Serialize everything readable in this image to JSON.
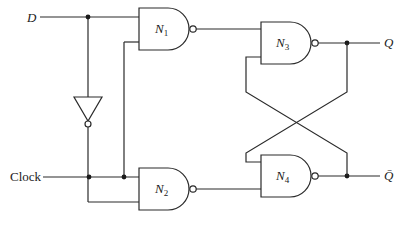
{
  "diagram": {
    "inputs": {
      "d": {
        "label": "D"
      },
      "clock": {
        "label": "Clock"
      }
    },
    "outputs": {
      "q": {
        "label": "Q"
      },
      "q_bar": {
        "label": "Q̄"
      }
    },
    "gates": [
      {
        "id": "N1",
        "type": "NAND",
        "name": "N",
        "subscript": "1"
      },
      {
        "id": "N2",
        "type": "NAND",
        "name": "N",
        "subscript": "2"
      },
      {
        "id": "N3",
        "type": "NAND",
        "name": "N",
        "subscript": "3"
      },
      {
        "id": "N4",
        "type": "NAND",
        "name": "N",
        "subscript": "4"
      }
    ],
    "inverter": {
      "type": "NOT",
      "input": "D",
      "output": "N2 lower input"
    },
    "connections": [
      "D -> N1 input 1",
      "D -> Inverter -> N2 input 2",
      "Clock -> N1 input 2",
      "Clock -> N2 input 1",
      "N1 -> N3 input 1",
      "N2 -> N4 input 2",
      "N3 output (Q) -> N4 input 1",
      "N4 output (Q̄) -> N3 input 2"
    ],
    "colors": {
      "line": "#2a2a2a",
      "background": "#ffffff"
    }
  }
}
